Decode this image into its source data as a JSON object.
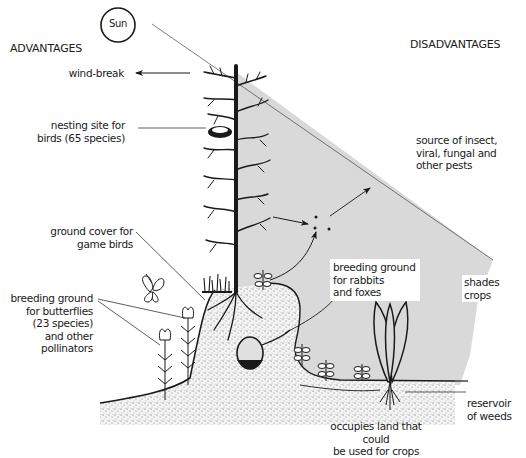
{
  "diagram": {
    "headings": {
      "left": "ADVANTAGES",
      "right": "DISADVANTAGES"
    },
    "sun": {
      "label": "Sun",
      "icon": "sun-icon"
    },
    "advantages": [
      {
        "id": "wind-break",
        "text": "wind-break"
      },
      {
        "id": "nesting-site",
        "text": "nesting site for\nbirds (65 species)"
      },
      {
        "id": "ground-cover",
        "text": "ground cover for\ngame birds"
      },
      {
        "id": "butterflies",
        "text": "breeding ground\nfor butterflies\n(23 species)\nand other\npollinators"
      }
    ],
    "disadvantages": [
      {
        "id": "pests",
        "text": "source of insect,\nviral, fungal and\nother pests"
      },
      {
        "id": "rabbits-foxes",
        "text": "breeding ground\nfor rabbits\nand foxes"
      },
      {
        "id": "shades-crops",
        "text": "shades crops"
      },
      {
        "id": "reservoir-weeds",
        "text": "reservoir\nof weeds"
      },
      {
        "id": "occupies-land",
        "text": "occupies land that could\nbe used for crops"
      }
    ],
    "colors": {
      "shade": "#d9d9d9",
      "ink": "#1a1a1a",
      "background": "#ffffff"
    },
    "icons": [
      "sun-icon",
      "hedge-tree-icon",
      "nest-icon",
      "butterfly-icon",
      "flower-icon",
      "rabbit-burrow-icon",
      "weed-icon",
      "crop-plant-icon",
      "pest-dots-icon"
    ]
  }
}
